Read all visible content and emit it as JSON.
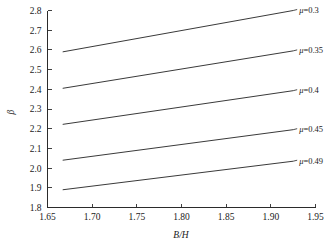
{
  "chart_data": {
    "type": "line",
    "title": "",
    "xlabel": "B/H",
    "ylabel": "β",
    "xlim": [
      1.65,
      1.95
    ],
    "ylim": [
      1.8,
      2.8
    ],
    "xticks": [
      "1.65",
      "1.70",
      "1.75",
      "1.80",
      "1.85",
      "1.90",
      "1.95"
    ],
    "xtick_values": [
      1.65,
      1.7,
      1.75,
      1.8,
      1.85,
      1.9,
      1.95
    ],
    "yticks": [
      "1.8",
      "1.9",
      "2.0",
      "2.1",
      "2.2",
      "2.3",
      "2.4",
      "2.5",
      "2.6",
      "2.7",
      "2.8"
    ],
    "ytick_values": [
      1.8,
      1.9,
      2.0,
      2.1,
      2.2,
      2.3,
      2.4,
      2.5,
      2.6,
      2.7,
      2.8
    ],
    "grid": false,
    "legend_position": "inline-right-end-of-line",
    "x": [
      1.667,
      1.925
    ],
    "series": [
      {
        "name": "μ=0.3",
        "mu": 0.3,
        "label_prefix": "μ",
        "label_value": "0.3",
        "values": [
          2.59,
          2.8
        ]
      },
      {
        "name": "μ=0.35",
        "mu": 0.35,
        "label_prefix": "μ",
        "label_value": "0.35",
        "values": [
          2.405,
          2.595
        ]
      },
      {
        "name": "μ=0.4",
        "mu": 0.4,
        "label_prefix": "μ",
        "label_value": "0.4",
        "values": [
          2.222,
          2.393
        ]
      },
      {
        "name": "μ=0.45",
        "mu": 0.45,
        "label_prefix": "μ",
        "label_value": "0.45",
        "values": [
          2.04,
          2.195
        ]
      },
      {
        "name": "μ=0.49",
        "mu": 0.49,
        "label_prefix": "μ",
        "label_value": "0.49",
        "values": [
          1.89,
          2.035
        ]
      }
    ],
    "colors": {
      "line": "#3a3a3a",
      "axis": "#2b2b2b",
      "text": "#1a1a1a",
      "background": "#ffffff"
    }
  }
}
